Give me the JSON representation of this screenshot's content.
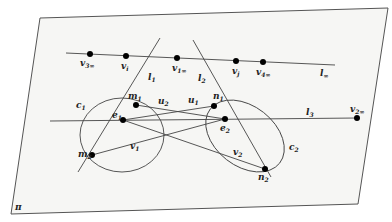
{
  "figure": {
    "plane_label": "π",
    "colors": {
      "stroke": "#444444",
      "plane_fill": "#f6f6f4",
      "point": "#000000",
      "text": "#222222"
    },
    "points": {
      "v3inf": {
        "name": "v",
        "sub": "3∞"
      },
      "vi": {
        "name": "v",
        "sub": "i"
      },
      "v1inf": {
        "name": "v",
        "sub": "1∞"
      },
      "vj": {
        "name": "v",
        "sub": "j"
      },
      "v4inf": {
        "name": "v",
        "sub": "4∞"
      },
      "v2inf": {
        "name": "v",
        "sub": "2∞"
      },
      "m1": {
        "name": "m",
        "sub": "1"
      },
      "m2": {
        "name": "m",
        "sub": "2"
      },
      "n1": {
        "name": "n",
        "sub": "1"
      },
      "n2": {
        "name": "n",
        "sub": "2"
      },
      "e1": {
        "name": "e",
        "sub": "1"
      },
      "e2": {
        "name": "e",
        "sub": "2"
      }
    },
    "lines": {
      "l_inf": {
        "name": "l",
        "sub": "∞"
      },
      "l1": {
        "name": "l",
        "sub": "1"
      },
      "l2": {
        "name": "l",
        "sub": "2"
      },
      "l3": {
        "name": "l",
        "sub": "3"
      },
      "u1": {
        "name": "u",
        "sub": "1"
      },
      "u2": {
        "name": "u",
        "sub": "2"
      },
      "v1": {
        "name": "v",
        "sub": "1"
      },
      "v2": {
        "name": "v",
        "sub": "2"
      }
    },
    "conics": {
      "c1": {
        "name": "c",
        "sub": "1"
      },
      "c2": {
        "name": "c",
        "sub": "2"
      }
    }
  }
}
